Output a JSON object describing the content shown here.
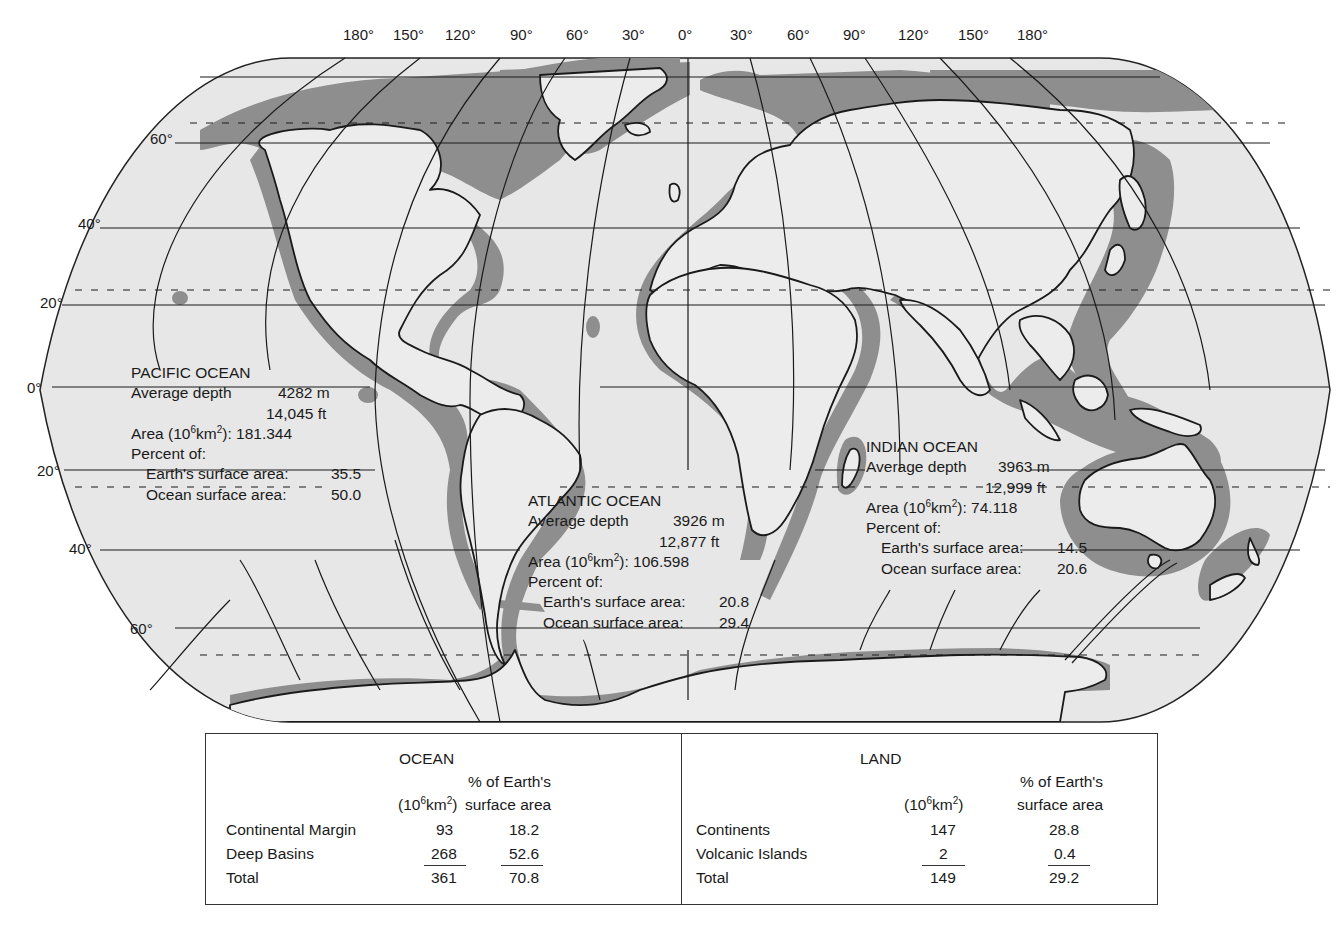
{
  "map": {
    "projection": "Robinson-like world map",
    "legend_shading": {
      "continental_margin_color": "#8c8c8c",
      "deep_ocean_color": "#e6e6e6",
      "land_color": "#ececec"
    },
    "longitude_labels": [
      "180°",
      "150°",
      "120°",
      "90°",
      "60°",
      "30°",
      "0°",
      "30°",
      "60°",
      "90°",
      "120°",
      "150°",
      "180°"
    ],
    "latitude_labels": {
      "n60": "60°",
      "n40": "40°",
      "n20": "20°",
      "eq": "0°",
      "s20": "20°",
      "s40": "40°",
      "s60": "60°"
    }
  },
  "oceans": {
    "pacific": {
      "name": "PACIFIC OCEAN",
      "depth_label": "Average depth",
      "depth_m": "4282 m",
      "depth_ft": "14,045 ft",
      "area_label_pre": "Area  (10",
      "area_exp1": "6",
      "area_label_mid": "km",
      "area_exp2": "2",
      "area_label_post": "): 181.344",
      "percent_label": "Percent of:",
      "earth_label": "Earth's surface area:",
      "earth_value": "35.5",
      "ocean_label": "Ocean surface area:",
      "ocean_value": "50.0"
    },
    "atlantic": {
      "name": "ATLANTIC OCEAN",
      "depth_label": "Average depth",
      "depth_m": "3926 m",
      "depth_ft": "12,877 ft",
      "area_label_pre": "Area  (10",
      "area_exp1": "6",
      "area_label_mid": "km",
      "area_exp2": "2",
      "area_label_post": "): 106.598",
      "percent_label": "Percent of:",
      "earth_label": "Earth's surface area:",
      "earth_value": "20.8",
      "ocean_label": "Ocean surface area:",
      "ocean_value": "29.4"
    },
    "indian": {
      "name": "INDIAN OCEAN",
      "depth_label": "Average depth",
      "depth_m": "3963 m",
      "depth_ft": "12,999 ft",
      "area_label_pre": "Area (10",
      "area_exp1": "6",
      "area_label_mid": "km",
      "area_exp2": "2",
      "area_label_post": "): 74.118",
      "percent_label": "Percent of:",
      "earth_label": "Earth's surface area:",
      "earth_value": "14.5",
      "ocean_label": "Ocean surface area:",
      "ocean_value": "20.6"
    }
  },
  "summary_table": {
    "ocean": {
      "title": "OCEAN",
      "col_area_pre": "(10",
      "col_area_exp1": "6",
      "col_area_mid": "km",
      "col_area_exp2": "2",
      "col_area_post": ")",
      "col_pct_line1": "% of Earth's",
      "col_pct_line2": "surface area",
      "rows": [
        {
          "label": "Continental Margin",
          "area": "93",
          "pct": "18.2"
        },
        {
          "label": "Deep Basins",
          "area": "268",
          "pct": "52.6"
        },
        {
          "label": "Total",
          "area": "361",
          "pct": "70.8"
        }
      ]
    },
    "land": {
      "title": "LAND",
      "col_area_pre": "(10",
      "col_area_exp1": "6",
      "col_area_mid": "km",
      "col_area_exp2": "2",
      "col_area_post": ")",
      "col_pct_line1": "% of Earth's",
      "col_pct_line2": "surface area",
      "rows": [
        {
          "label": "Continents",
          "area": "147",
          "pct": "28.8"
        },
        {
          "label": "Volcanic Islands",
          "area": "2",
          "pct": "0.4"
        },
        {
          "label": "Total",
          "area": "149",
          "pct": "29.2"
        }
      ]
    }
  }
}
